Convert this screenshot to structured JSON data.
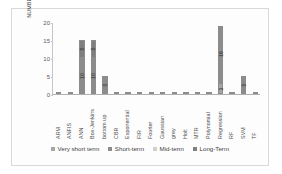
{
  "chart_data": {
    "type": "bar",
    "stacked": true,
    "title": "",
    "xlabel": "",
    "ylabel": "NUMBER OF PAPERS",
    "ylim": [
      0,
      20
    ],
    "yticks": [
      0,
      5,
      10,
      15,
      20
    ],
    "grid": false,
    "legend_position": "bottom",
    "categories": [
      "ARM",
      "ANFIS",
      "ANN",
      "Box-Jenkins",
      "bottom up",
      "CBR",
      "Exponential",
      "FIR",
      "Fourier",
      "Gaussian",
      "grey",
      "Holt",
      "MTR",
      "Polynomial",
      "Regression",
      "RF",
      "SVM",
      "TF"
    ],
    "series": [
      {
        "name": "Very short term",
        "color": "#a6a6a6",
        "values": [
          0,
          0,
          0,
          0,
          0,
          0,
          0,
          0,
          0,
          0,
          0,
          0,
          0,
          0,
          3,
          0,
          0,
          0
        ],
        "labels": [
          "",
          "",
          "",
          "",
          "",
          "",
          "",
          "",
          "",
          "",
          "",
          "",
          "",
          "",
          "3",
          "",
          "",
          ""
        ]
      },
      {
        "name": "Short-term",
        "color": "#8c8c8c",
        "values": [
          0,
          0,
          10,
          10,
          5,
          0,
          0,
          0,
          0,
          0,
          0,
          0,
          0,
          0,
          16,
          0,
          5,
          0
        ],
        "labels": [
          "",
          "",
          "10",
          "10",
          "5",
          "",
          "",
          "",
          "",
          "",
          "",
          "",
          "",
          "",
          "16",
          "",
          "5",
          ""
        ]
      },
      {
        "name": "Mid-term",
        "color": "#d0d0d0",
        "values": [
          0,
          0,
          0,
          0,
          0,
          0,
          0,
          0,
          0,
          0,
          0,
          0,
          0,
          0,
          0,
          0,
          0,
          0
        ],
        "labels": [
          "",
          "",
          "",
          "",
          "",
          "",
          "",
          "",
          "",
          "",
          "",
          "",
          "",
          "",
          "",
          "",
          "",
          ""
        ]
      },
      {
        "name": "Long-Term",
        "color": "#7f7f7f",
        "values": [
          0,
          0,
          5,
          5,
          0,
          0,
          0,
          0,
          0,
          0,
          0,
          0,
          0,
          0,
          0,
          0,
          0,
          0
        ],
        "labels": [
          "",
          "",
          "5",
          "5",
          "",
          "",
          "",
          "",
          "",
          "",
          "",
          "",
          "",
          "",
          "",
          "",
          "",
          ""
        ]
      }
    ]
  }
}
